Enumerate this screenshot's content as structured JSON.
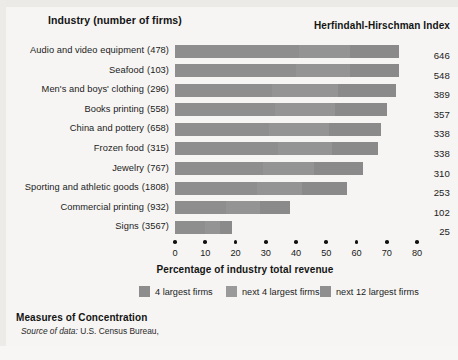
{
  "header": {
    "left_title": "Industry (number of firms)",
    "right_title": "Herfindahl-Hirschman Index"
  },
  "axis": {
    "title": "Percentage of industry total revenue",
    "ticks": [
      "0",
      "10",
      "20",
      "30",
      "40",
      "50",
      "60",
      "70",
      "80"
    ]
  },
  "legend": {
    "items": [
      {
        "label": "4 largest firms",
        "color": "#8d8d8d"
      },
      {
        "label": "next 4 largest firms",
        "color": "#9a9a9a"
      },
      {
        "label": "next 12 largest firms",
        "color": "#8f8f8f"
      }
    ]
  },
  "footer": {
    "title": "Measures of Concentration",
    "source_label": "Source of data:",
    "source_value": "U.S. Census Bureau,"
  },
  "rows": [
    {
      "industry": "Audio and video equipment",
      "firms": "(478)",
      "hhi": "646"
    },
    {
      "industry": "Seafood",
      "firms": "(103)",
      "hhi": "548"
    },
    {
      "industry": "Men's and boys' clothing",
      "firms": "(296)",
      "hhi": "389"
    },
    {
      "industry": "Books printing",
      "firms": "(558)",
      "hhi": "357"
    },
    {
      "industry": "China and pottery",
      "firms": "(658)",
      "hhi": "338"
    },
    {
      "industry": "Frozen food",
      "firms": "(315)",
      "hhi": "338"
    },
    {
      "industry": "Jewelry",
      "firms": "(767)",
      "hhi": "310"
    },
    {
      "industry": "Sporting and athletic goods",
      "firms": "(1808)",
      "hhi": "253"
    },
    {
      "industry": "Commercial printing",
      "firms": "(932)",
      "hhi": "102"
    },
    {
      "industry": "Signs",
      "firms": "(3567)",
      "hhi": "25"
    }
  ],
  "chart_data": {
    "type": "bar",
    "orientation": "horizontal",
    "stacked": true,
    "title": "Measures of Concentration",
    "xlabel": "Percentage of industry total revenue",
    "ylabel": "Industry (number of firms)",
    "xlim": [
      0,
      80
    ],
    "xticks": [
      0,
      10,
      20,
      30,
      40,
      50,
      60,
      70,
      80
    ],
    "grid": false,
    "legend_position": "bottom",
    "categories": [
      "Audio and video equipment (478)",
      "Seafood (103)",
      "Men's and boys' clothing (296)",
      "Books printing (558)",
      "China and pottery (658)",
      "Frozen food (315)",
      "Jewelry (767)",
      "Sporting and athletic goods (1808)",
      "Commercial printing (932)",
      "Signs (3567)"
    ],
    "series": [
      {
        "name": "4 largest firms",
        "values": [
          41,
          40,
          32,
          33,
          31,
          34,
          29,
          27,
          17,
          10
        ]
      },
      {
        "name": "next 4 largest firms",
        "values": [
          17,
          18,
          22,
          20,
          20,
          18,
          17,
          15,
          11,
          5
        ]
      },
      {
        "name": "next 12 largest firms",
        "values": [
          16,
          16,
          19,
          17,
          17,
          15,
          16,
          15,
          10,
          4
        ]
      }
    ],
    "totals": [
      74,
      74,
      73.5,
      70.5,
      68,
      67,
      62,
      57,
      38,
      19.5
    ],
    "annotations": {
      "right_axis_title": "Herfindahl-Hirschman Index",
      "right_values": [
        646,
        548,
        389,
        357,
        338,
        338,
        310,
        253,
        102,
        25
      ]
    },
    "source": "Source of data: U.S. Census Bureau,"
  }
}
